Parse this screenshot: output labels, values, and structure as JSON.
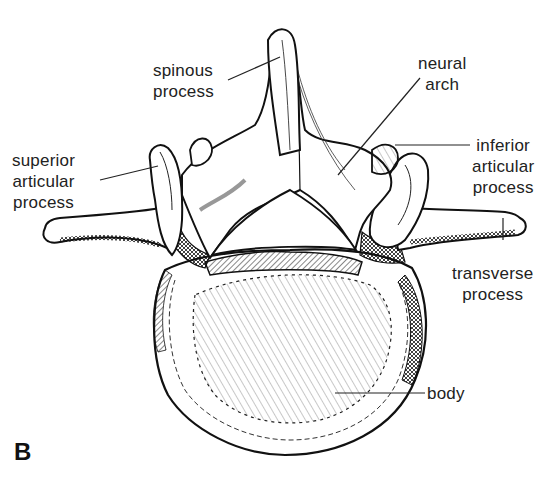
{
  "figure": {
    "panel_letter": "B",
    "colors": {
      "ink": "#111111",
      "background": "#ffffff"
    }
  },
  "labels": {
    "spinous_process": {
      "line1": "spinous",
      "line2": "process"
    },
    "neural_arch": {
      "line1": "neural",
      "line2": "arch"
    },
    "superior_articular_process": {
      "line1": "superior",
      "line2": "articular",
      "line3": "process"
    },
    "inferior_articular_process": {
      "line1": "inferior",
      "line2": "articular",
      "line3": "process"
    },
    "transverse_process": {
      "line1": "transverse",
      "line2": "process"
    },
    "body": {
      "line1": "body"
    }
  }
}
